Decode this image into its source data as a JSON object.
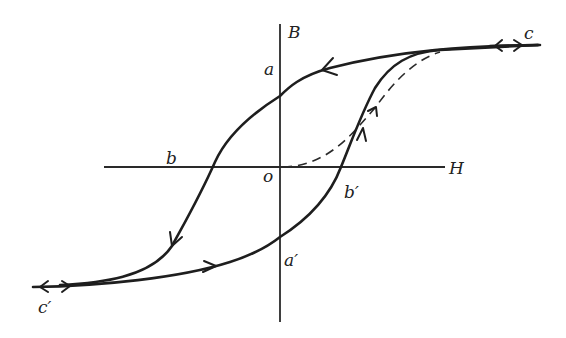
{
  "figure": {
    "title": "",
    "type": "magnetic hysteresis loop (B–H curve)",
    "axes": {
      "horizontal_label": "H",
      "vertical_label": "B",
      "origin_label": "o"
    },
    "points": {
      "a": "a",
      "a_prime": "a′",
      "b": "b",
      "b_prime": "b′",
      "c": "c",
      "c_prime": "c′"
    },
    "curves": [
      {
        "name": "initial-magnetization",
        "style": "dashed",
        "from": "o",
        "to": "c",
        "direction": "o → c"
      },
      {
        "name": "descending-branch",
        "style": "solid",
        "path": "c → a → b → c′",
        "direction": "decreasing H"
      },
      {
        "name": "ascending-branch",
        "style": "solid",
        "path": "c′ → a′ → b′ → c",
        "direction": "increasing H"
      }
    ],
    "colors": {
      "ink": "#1e1e1e",
      "background": "#ffffff"
    }
  }
}
